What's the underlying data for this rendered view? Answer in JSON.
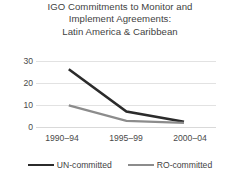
{
  "chart_data": {
    "type": "line",
    "title": "IGO Commitments to Monitor and Implement Agreements: Latin America & Caribbean",
    "title_lines": [
      "IGO Commitments to Monitor and",
      "Implement Agreements:",
      "Latin America & Caribbean"
    ],
    "xlabel": "",
    "ylabel": "",
    "categories": [
      "1990–94",
      "1995–99",
      "2000–04"
    ],
    "yticks": [
      0,
      10,
      20,
      30
    ],
    "ylim": [
      0,
      32
    ],
    "grid": true,
    "legend_position": "bottom",
    "series": [
      {
        "name": "UN-committed",
        "color": "#2b2b2b",
        "values": [
          28,
          7.5,
          2.5
        ]
      },
      {
        "name": "RO-committed",
        "color": "#8c8c8c",
        "values": [
          10.5,
          3,
          2
        ]
      }
    ]
  },
  "axes": {
    "ytick_labels": [
      "30",
      "20",
      "10",
      "0"
    ],
    "xtick_labels": [
      "1990–94",
      "1995–99",
      "2000–04"
    ]
  },
  "legend": {
    "items": [
      {
        "label": "UN-committed",
        "color": "#2b2b2b"
      },
      {
        "label": "RO-committed",
        "color": "#8c8c8c"
      }
    ]
  }
}
